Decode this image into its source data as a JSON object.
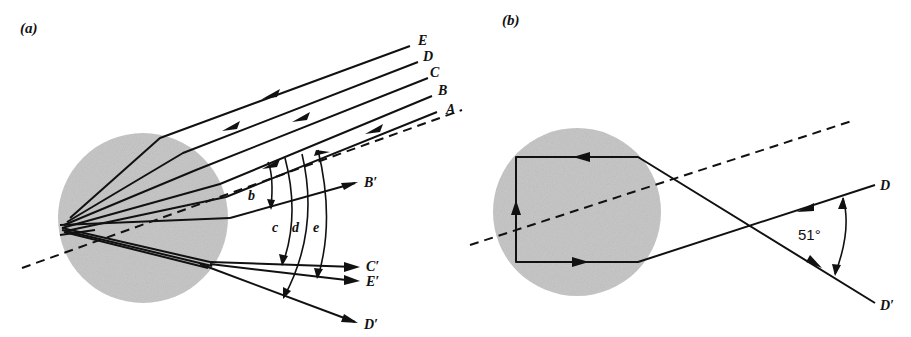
{
  "panels": {
    "a": {
      "label": "(a)",
      "incoming_rays": [
        "E",
        "D",
        "C",
        "B",
        "A"
      ],
      "outgoing_rays": [
        "B′",
        "C′",
        "E′",
        "D′"
      ],
      "angle_labels": [
        "b",
        "c",
        "d",
        "e"
      ],
      "description": "Parallel rays A–E enter a spherical drop, reflect internally and exit at different deviation angles"
    },
    "b": {
      "label": "(b)",
      "incoming_ray": "D",
      "outgoing_ray": "D′",
      "angle_value": "51°",
      "description": "Ray D undergoes two internal reflections inside the drop and exits as D′ at 51°"
    }
  },
  "colors": {
    "drop_fill": "#c8c8c8",
    "line": "#111111",
    "background": "#ffffff"
  }
}
